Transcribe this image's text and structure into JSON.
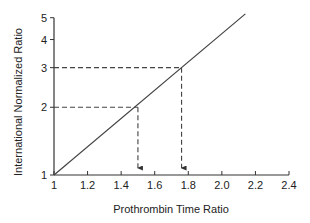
{
  "chart_data": {
    "type": "line",
    "title": "",
    "xlabel": "Prothrombin Time Ratio",
    "ylabel": "International Normalized Ratio",
    "x_scale": "linear",
    "y_scale": "log",
    "xlim": [
      1,
      2.4
    ],
    "ylim": [
      1,
      5
    ],
    "x_ticks": [
      "1",
      "1.2",
      "1.4",
      "1.6",
      "1.8",
      "2.0",
      "2.2",
      "2.4"
    ],
    "x_tick_values": [
      1,
      1.2,
      1.4,
      1.6,
      1.8,
      2.0,
      2.2,
      2.4
    ],
    "y_ticks": [
      "1",
      "2",
      "3",
      "4",
      "5"
    ],
    "y_tick_values": [
      1,
      2,
      3,
      4,
      5
    ],
    "grid": false,
    "legend": null,
    "series": [
      {
        "name": "INR vs PT ratio",
        "style": "solid",
        "x": [
          1.0,
          2.14
        ],
        "y": [
          1.0,
          5.2
        ]
      }
    ],
    "annotations": [
      {
        "type": "dashed-guide",
        "x": 1.5,
        "y": 2.0,
        "description": "horizontal dashed line from INR 2 to curve, vertical dashed arrow down to PT ratio 1.5"
      },
      {
        "type": "dashed-guide",
        "x": 1.76,
        "y": 3.0,
        "description": "horizontal dashed line from INR 3 to curve, vertical dashed arrow down to PT ratio ~1.76"
      }
    ]
  },
  "colors": {
    "axis": "#333333",
    "line": "#444444",
    "dashed": "#444444",
    "background": "#ffffff"
  }
}
